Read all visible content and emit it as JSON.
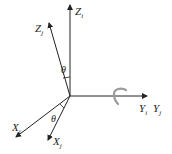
{
  "diagram": {
    "type": "coordinate-frame-rotation",
    "axes": {
      "z_i": {
        "label": "Z",
        "sub": "i"
      },
      "z_j": {
        "label": "Z",
        "sub": "j"
      },
      "y_i": {
        "label": "Y",
        "sub": "i"
      },
      "y_j": {
        "label": "Y",
        "sub": "j"
      },
      "x_i": {
        "label": "X",
        "sub": "i"
      },
      "x_j": {
        "label": "X",
        "sub": "j"
      }
    },
    "angles": {
      "z_angle": "θ",
      "x_angle": "θ"
    },
    "rotation_axis": "Y",
    "colors": {
      "axis": "#222222",
      "rotation_arrow": "#9a9a9a"
    }
  }
}
